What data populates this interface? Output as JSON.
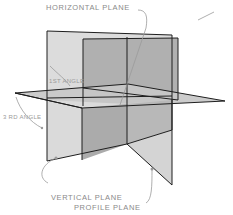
{
  "diagram": {
    "type": "projection-planes-isometric",
    "labels": {
      "horizontal_plane": "HORIZONTAL PLANE",
      "first_angle": "1ST ANGLE",
      "third_angle": "3 RD ANGLE",
      "vertical_plane": "VERTICAL PLANE",
      "profile_plane": "PROFILE PLANE"
    },
    "colors": {
      "background": "#ffffff",
      "outline": "#1e1e1e",
      "vertical_plane_light": "#dcdcdc",
      "vertical_plane_dark": "#b4b4b4",
      "profile_plane": "#a9a9a9",
      "horizontal_plane": "#c4c4c4",
      "leader_lines": "#9a9a9a",
      "label_text": "#8a8a8a"
    }
  }
}
